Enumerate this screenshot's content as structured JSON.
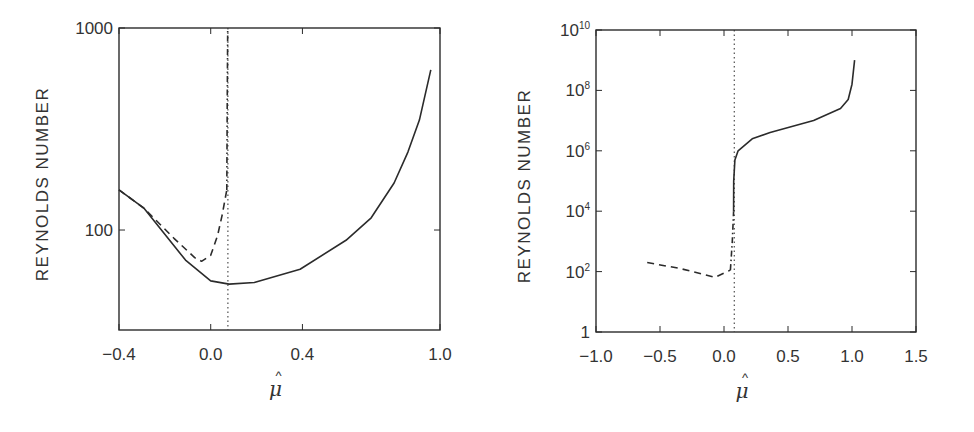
{
  "chart_data": [
    {
      "type": "line",
      "panel": "left",
      "title": "",
      "xlabel": "μ̂",
      "ylabel": "REYNOLDS NUMBER",
      "xscale": "linear",
      "yscale": "log",
      "xlim": [
        -0.4,
        1.0
      ],
      "ylim": [
        32,
        1000
      ],
      "xticks": [
        -0.4,
        0.0,
        0.4,
        1.0
      ],
      "xtick_labels": [
        "−0.4",
        "0.0",
        "0.4",
        "1.0"
      ],
      "yticks": [
        100,
        1000
      ],
      "ytick_labels": [
        "100",
        "1000"
      ],
      "grid": false,
      "legend": null,
      "vertical_line": {
        "x": 0.075,
        "style": "dotted"
      },
      "series": [
        {
          "name": "solid",
          "style": "solid",
          "x": [
            -0.4,
            -0.29,
            -0.11,
            0.0,
            0.08,
            0.19,
            0.39,
            0.59,
            0.7,
            0.8,
            0.86,
            0.91,
            0.96
          ],
          "y": [
            158,
            128,
            71,
            56,
            54,
            55,
            64,
            89,
            115,
            171,
            243,
            350,
            620
          ]
        },
        {
          "name": "dashed",
          "style": "dashed",
          "x": [
            -0.4,
            -0.29,
            -0.16,
            -0.07,
            -0.04,
            0.0,
            0.03,
            0.05,
            0.07
          ],
          "y": [
            158,
            128,
            91,
            73,
            70,
            75,
            94,
            119,
            158
          ]
        },
        {
          "name": "dash-dot",
          "style": "dashdot",
          "x": [
            0.07,
            0.072,
            0.074
          ],
          "y": [
            158,
            400,
            1000
          ]
        }
      ]
    },
    {
      "type": "line",
      "panel": "right",
      "title": "",
      "xlabel": "μ̂",
      "ylabel": "REYNOLDS NUMBER",
      "xscale": "linear",
      "yscale": "log",
      "xlim": [
        -1.0,
        1.5
      ],
      "ylim": [
        1,
        10000000000.0
      ],
      "xticks": [
        -1.0,
        -0.5,
        0.0,
        0.5,
        1.0,
        1.5
      ],
      "xtick_labels": [
        "−1.0",
        "−0.5",
        "0.0",
        "0.5",
        "1.0",
        "1.5"
      ],
      "yticks": [
        1,
        100,
        10000,
        1000000,
        100000000,
        10000000000
      ],
      "ytick_labels": [
        {
          "base": "1",
          "exp": ""
        },
        {
          "base": "10",
          "exp": "2"
        },
        {
          "base": "10",
          "exp": "4"
        },
        {
          "base": "10",
          "exp": "6"
        },
        {
          "base": "10",
          "exp": "8"
        },
        {
          "base": "10",
          "exp": "10"
        }
      ],
      "grid": false,
      "legend": null,
      "vertical_line": {
        "x": 0.08,
        "style": "dotted"
      },
      "series": [
        {
          "name": "dashed",
          "style": "dashed",
          "x": [
            -0.6,
            -0.34,
            -0.07,
            0.05
          ],
          "y": [
            200,
            126,
            65,
            112
          ]
        },
        {
          "name": "dash-dot",
          "style": "dashdot",
          "x": [
            0.05,
            0.065,
            0.075
          ],
          "y": [
            112,
            1000,
            10000
          ]
        },
        {
          "name": "solid",
          "style": "solid",
          "x": [
            0.075,
            0.076,
            0.085,
            0.11,
            0.22,
            0.36,
            0.7,
            0.91,
            0.97,
            1.0,
            1.02
          ],
          "y": [
            10000,
            100000,
            500000,
            1000000,
            2500000,
            4000000,
            10000000,
            25000000,
            50000000,
            160000000,
            1000000000
          ]
        }
      ]
    }
  ]
}
